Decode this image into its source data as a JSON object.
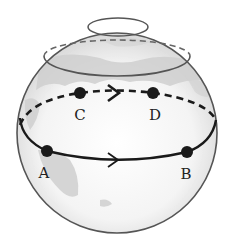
{
  "diagram": {
    "type": "globe-with-latitude-paths",
    "points": [
      {
        "id": "A",
        "label": "A",
        "x": 47,
        "y": 151,
        "label_x": 44,
        "label_y": 178
      },
      {
        "id": "B",
        "label": "B",
        "x": 187,
        "y": 152,
        "label_x": 186,
        "label_y": 179
      },
      {
        "id": "C",
        "label": "C",
        "x": 80,
        "y": 93,
        "label_x": 80,
        "label_y": 120
      },
      {
        "id": "D",
        "label": "D",
        "x": 153,
        "y": 93,
        "label_x": 155,
        "label_y": 120
      }
    ],
    "paths": [
      {
        "name": "lower-path-A-to-B",
        "style": "solid",
        "arrow_direction": "right"
      },
      {
        "name": "upper-path-C-to-D",
        "style": "dashed",
        "arrow_direction": "right"
      }
    ],
    "colors": {
      "outline": "#555555",
      "path": "#1a1a1a",
      "land": "#c8c8c8",
      "background": "#ffffff"
    }
  }
}
